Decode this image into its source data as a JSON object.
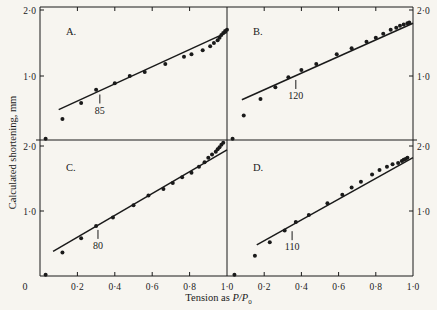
{
  "figure": {
    "ylabel": "Calculated shortening, mm",
    "xlabel_prefix": "Tension as ",
    "xlabel_math": "P/P",
    "xlabel_sub": "0",
    "origin_label": "0"
  },
  "chart_data": [
    {
      "type": "scatter",
      "panel": "A.",
      "position": "top-left",
      "xlabel": "Tension as P/P0",
      "ylabel": "Calculated shortening, mm",
      "xlim": [
        0,
        1.0
      ],
      "ylim": [
        0,
        2.0
      ],
      "yticks": [
        "1·0",
        "2·0"
      ],
      "xticks": [
        "0·2",
        "0·4",
        "0·6",
        "0·8",
        "1·0"
      ],
      "annotation": {
        "label": "85",
        "x": 0.32,
        "y": 0.75
      },
      "fit_line": {
        "x": [
          0.1,
          1.0
        ],
        "y": [
          0.49,
          1.66
        ]
      },
      "points": [
        [
          0.03,
          0.05
        ],
        [
          0.12,
          0.35
        ],
        [
          0.22,
          0.59
        ],
        [
          0.3,
          0.79
        ],
        [
          0.4,
          0.89
        ],
        [
          0.48,
          1.0
        ],
        [
          0.56,
          1.06
        ],
        [
          0.67,
          1.18
        ],
        [
          0.77,
          1.29
        ],
        [
          0.81,
          1.33
        ],
        [
          0.87,
          1.39
        ],
        [
          0.91,
          1.45
        ],
        [
          0.93,
          1.5
        ],
        [
          0.95,
          1.54
        ],
        [
          0.96,
          1.58
        ],
        [
          0.97,
          1.62
        ],
        [
          0.98,
          1.65
        ],
        [
          0.99,
          1.68
        ],
        [
          1.0,
          1.7
        ]
      ]
    },
    {
      "type": "scatter",
      "panel": "B.",
      "position": "top-right",
      "xlim": [
        0,
        1.0
      ],
      "ylim": [
        0,
        2.0
      ],
      "yticks": [
        "1·0",
        "2·0"
      ],
      "annotation": {
        "label": "120",
        "x": 0.37,
        "y": 0.97
      },
      "fit_line": {
        "x": [
          0.08,
          1.0
        ],
        "y": [
          0.64,
          1.8
        ]
      },
      "points": [
        [
          0.03,
          0.05
        ],
        [
          0.09,
          0.4
        ],
        [
          0.18,
          0.65
        ],
        [
          0.26,
          0.83
        ],
        [
          0.33,
          0.98
        ],
        [
          0.4,
          1.09
        ],
        [
          0.48,
          1.18
        ],
        [
          0.59,
          1.33
        ],
        [
          0.67,
          1.42
        ],
        [
          0.75,
          1.52
        ],
        [
          0.8,
          1.58
        ],
        [
          0.84,
          1.64
        ],
        [
          0.88,
          1.7
        ],
        [
          0.91,
          1.73
        ],
        [
          0.93,
          1.76
        ],
        [
          0.95,
          1.78
        ],
        [
          0.97,
          1.8
        ],
        [
          0.98,
          1.81
        ]
      ]
    },
    {
      "type": "scatter",
      "panel": "C.",
      "position": "bottom-left",
      "xlim": [
        0,
        1.0
      ],
      "ylim": [
        0,
        2.0
      ],
      "yticks": [
        "1·0",
        "2·0"
      ],
      "xticks": [
        "0·2",
        "0·4",
        "0·6",
        "0·8",
        "1·0"
      ],
      "annotation": {
        "label": "80",
        "x": 0.31,
        "y": 0.74
      },
      "fit_line": {
        "x": [
          0.07,
          1.0
        ],
        "y": [
          0.38,
          1.94
        ]
      },
      "points": [
        [
          0.03,
          0.02
        ],
        [
          0.12,
          0.36
        ],
        [
          0.22,
          0.58
        ],
        [
          0.3,
          0.77
        ],
        [
          0.39,
          0.9
        ],
        [
          0.5,
          1.09
        ],
        [
          0.58,
          1.24
        ],
        [
          0.66,
          1.34
        ],
        [
          0.71,
          1.43
        ],
        [
          0.76,
          1.52
        ],
        [
          0.81,
          1.59
        ],
        [
          0.85,
          1.68
        ],
        [
          0.88,
          1.75
        ],
        [
          0.9,
          1.82
        ],
        [
          0.92,
          1.87
        ],
        [
          0.94,
          1.91
        ],
        [
          0.95,
          1.95
        ],
        [
          0.96,
          1.98
        ],
        [
          0.97,
          2.02
        ],
        [
          0.98,
          2.05
        ]
      ]
    },
    {
      "type": "scatter",
      "panel": "D.",
      "position": "bottom-right",
      "xlim": [
        0,
        1.0
      ],
      "ylim": [
        0,
        2.0
      ],
      "yticks": [
        "1·0",
        "2·0"
      ],
      "xticks": [
        "0·2",
        "0·4",
        "0·6",
        "0·8",
        "1·0"
      ],
      "annotation": {
        "label": "110",
        "x": 0.35,
        "y": 0.72
      },
      "fit_line": {
        "x": [
          0.16,
          1.0
        ],
        "y": [
          0.48,
          1.82
        ]
      },
      "points": [
        [
          0.04,
          0.02
        ],
        [
          0.15,
          0.31
        ],
        [
          0.23,
          0.52
        ],
        [
          0.31,
          0.7
        ],
        [
          0.37,
          0.83
        ],
        [
          0.44,
          0.94
        ],
        [
          0.54,
          1.12
        ],
        [
          0.62,
          1.25
        ],
        [
          0.67,
          1.36
        ],
        [
          0.72,
          1.45
        ],
        [
          0.78,
          1.56
        ],
        [
          0.82,
          1.63
        ],
        [
          0.86,
          1.68
        ],
        [
          0.89,
          1.72
        ],
        [
          0.92,
          1.74
        ],
        [
          0.94,
          1.77
        ],
        [
          0.95,
          1.79
        ],
        [
          0.96,
          1.8
        ],
        [
          0.97,
          1.82
        ]
      ]
    }
  ]
}
